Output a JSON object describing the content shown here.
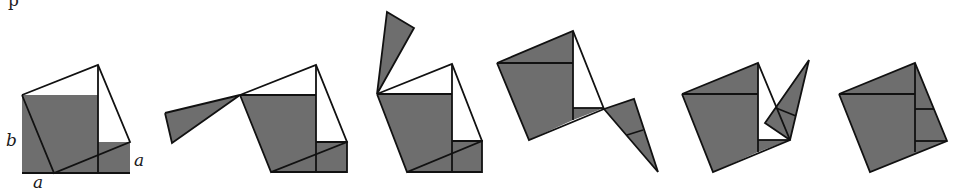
{
  "diagram": {
    "colors": {
      "fill": "#6e6e6e",
      "stroke": "#111111",
      "background": "#ffffff"
    },
    "top_fragment": "p",
    "labels": [
      {
        "id": "label-b",
        "text": "b",
        "x": 6,
        "y": 132
      },
      {
        "id": "label-a-bottom",
        "text": "a",
        "x": 33,
        "y": 174
      },
      {
        "id": "label-a-right",
        "text": "a",
        "x": 134,
        "y": 152
      }
    ],
    "figures": [
      {
        "name": "stage-1",
        "filled": [
          [
            [
              22,
              95
            ],
            [
              98,
              95
            ],
            [
              98,
              173
            ],
            [
              22,
              173
            ]
          ],
          [
            [
              98,
              142
            ],
            [
              130,
              142
            ],
            [
              130,
              173
            ],
            [
              98,
              173
            ]
          ]
        ],
        "lines": [
          [
            [
              22,
              95
            ],
            [
              98,
              65
            ],
            [
              130,
              142
            ],
            [
              54,
              173
            ],
            [
              22,
              95
            ]
          ],
          [
            [
              98,
              65
            ],
            [
              98,
              173
            ]
          ],
          [
            [
              22,
              173
            ],
            [
              130,
              173
            ]
          ]
        ]
      },
      {
        "name": "stage-2",
        "filled": [
          [
            [
              240,
              95
            ],
            [
              316,
              95
            ],
            [
              316,
              172
            ],
            [
              271,
              172
            ]
          ],
          [
            [
              316,
              142
            ],
            [
              347,
              142
            ],
            [
              347,
              172
            ],
            [
              316,
              172
            ]
          ],
          [
            [
              165,
              113
            ],
            [
              240,
              95
            ],
            [
              172,
              143
            ]
          ]
        ],
        "lines": [
          [
            [
              240,
              95
            ],
            [
              316,
              65
            ],
            [
              347,
              142
            ],
            [
              271,
              172
            ],
            [
              240,
              95
            ]
          ],
          [
            [
              240,
              95
            ],
            [
              316,
              95
            ]
          ],
          [
            [
              316,
              65
            ],
            [
              316,
              172
            ]
          ],
          [
            [
              316,
              142
            ],
            [
              347,
              142
            ],
            [
              347,
              172
            ],
            [
              271,
              172
            ]
          ],
          [
            [
              165,
              113
            ],
            [
              240,
              95
            ],
            [
              172,
              143
            ],
            [
              165,
              113
            ]
          ]
        ]
      },
      {
        "name": "stage-3",
        "filled": [
          [
            [
              377,
              94
            ],
            [
              452,
              94
            ],
            [
              452,
              172
            ],
            [
              407,
              172
            ]
          ],
          [
            [
              452,
              141
            ],
            [
              482,
              141
            ],
            [
              482,
              172
            ],
            [
              452,
              172
            ]
          ],
          [
            [
              377,
              94
            ],
            [
              387,
              12
            ],
            [
              414,
              28
            ]
          ]
        ],
        "lines": [
          [
            [
              377,
              94
            ],
            [
              452,
              64
            ],
            [
              482,
              141
            ],
            [
              407,
              172
            ],
            [
              377,
              94
            ]
          ],
          [
            [
              377,
              94
            ],
            [
              452,
              94
            ]
          ],
          [
            [
              452,
              64
            ],
            [
              452,
              172
            ]
          ],
          [
            [
              452,
              141
            ],
            [
              482,
              141
            ],
            [
              482,
              172
            ],
            [
              407,
              172
            ]
          ],
          [
            [
              377,
              94
            ],
            [
              387,
              12
            ],
            [
              414,
              28
            ],
            [
              377,
              94
            ]
          ]
        ]
      },
      {
        "name": "stage-4",
        "filled": [
          [
            [
              497,
              63
            ],
            [
              573,
              31
            ],
            [
              573,
              120
            ],
            [
              529,
              140
            ]
          ],
          [
            [
              573,
              108
            ],
            [
              604,
              108
            ],
            [
              573,
              120
            ]
          ],
          [
            [
              604,
              109
            ],
            [
              634,
              99
            ],
            [
              658,
              172
            ]
          ]
        ],
        "lines": [
          [
            [
              497,
              63
            ],
            [
              573,
              31
            ],
            [
              604,
              109
            ]
          ],
          [
            [
              497,
              63
            ],
            [
              529,
              140
            ],
            [
              604,
              109
            ]
          ],
          [
            [
              497,
              63
            ],
            [
              573,
              63
            ]
          ],
          [
            [
              573,
              31
            ],
            [
              573,
              120
            ]
          ],
          [
            [
              573,
              108
            ],
            [
              604,
              108
            ]
          ],
          [
            [
              604,
              109
            ],
            [
              634,
              99
            ],
            [
              658,
              172
            ],
            [
              604,
              109
            ]
          ],
          [
            [
              627,
              135
            ],
            [
              643,
              130
            ]
          ]
        ]
      },
      {
        "name": "stage-5",
        "filled": [
          [
            [
              682,
              94
            ],
            [
              758,
              63
            ],
            [
              758,
              152
            ],
            [
              713,
              172
            ]
          ],
          [
            [
              758,
              140
            ],
            [
              790,
              140
            ],
            [
              758,
              152
            ]
          ],
          [
            [
              790,
              140
            ],
            [
              809,
              60
            ],
            [
              765,
              123
            ]
          ]
        ],
        "lines": [
          [
            [
              682,
              94
            ],
            [
              758,
              63
            ],
            [
              790,
              140
            ],
            [
              713,
              172
            ],
            [
              682,
              94
            ]
          ],
          [
            [
              682,
              94
            ],
            [
              758,
              94
            ]
          ],
          [
            [
              758,
              63
            ],
            [
              758,
              152
            ]
          ],
          [
            [
              758,
              140
            ],
            [
              790,
              140
            ]
          ],
          [
            [
              790,
              140
            ],
            [
              809,
              60
            ],
            [
              765,
              123
            ],
            [
              790,
              140
            ]
          ],
          [
            [
              776,
              108
            ],
            [
              796,
              116
            ]
          ]
        ]
      },
      {
        "name": "stage-6",
        "filled": [
          [
            [
              839,
              94
            ],
            [
              915,
              63
            ],
            [
              947,
              141
            ],
            [
              870,
              172
            ]
          ]
        ],
        "lines": [
          [
            [
              839,
              94
            ],
            [
              915,
              63
            ],
            [
              947,
              141
            ],
            [
              870,
              172
            ],
            [
              839,
              94
            ]
          ],
          [
            [
              839,
              94
            ],
            [
              915,
              94
            ]
          ],
          [
            [
              915,
              63
            ],
            [
              915,
              152
            ]
          ],
          [
            [
              915,
              109
            ],
            [
              934,
              109
            ]
          ],
          [
            [
              915,
              141
            ],
            [
              947,
              141
            ]
          ]
        ]
      }
    ]
  }
}
